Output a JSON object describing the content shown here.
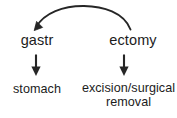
{
  "diagram": {
    "background_color": "#ffffff",
    "stroke_color": "#262626",
    "text_color": "#1c1c1c",
    "morphemes": [
      {
        "id": "gastr",
        "label": "gastr",
        "gloss": "stomach"
      },
      {
        "id": "ectomy",
        "label": "ectomy",
        "gloss_line1": "excision/surgical",
        "gloss_line2": "removal"
      }
    ],
    "arrows": {
      "curved": {
        "name": "ectomy-to-gastr-curved-arrow",
        "from": "ectomy",
        "to": "gastr",
        "direction": "right-to-left"
      },
      "vertical_left": {
        "name": "gastr-to-stomach-arrow",
        "from": "gastr",
        "to": "stomach",
        "direction": "down"
      },
      "vertical_right": {
        "name": "ectomy-to-excision-arrow",
        "from": "ectomy",
        "to": "excision/surgical removal",
        "direction": "down"
      }
    }
  }
}
